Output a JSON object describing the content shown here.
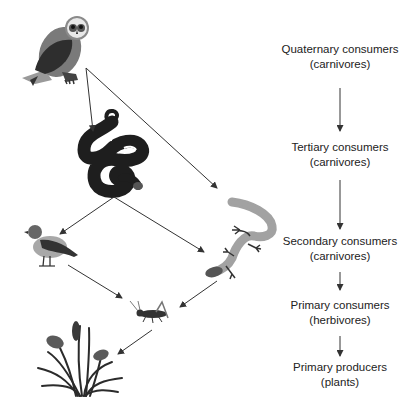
{
  "diagram": {
    "type": "food-web",
    "organisms": [
      {
        "id": "owl",
        "icon": "owl-icon",
        "level": "quaternary"
      },
      {
        "id": "snake",
        "icon": "snake-icon",
        "level": "tertiary"
      },
      {
        "id": "bird",
        "icon": "bird-icon",
        "level": "secondary"
      },
      {
        "id": "lizard",
        "icon": "lizard-icon",
        "level": "secondary"
      },
      {
        "id": "grasshopper",
        "icon": "grasshopper-icon",
        "level": "primary"
      },
      {
        "id": "plants",
        "icon": "cattail-plants-icon",
        "level": "producer"
      }
    ],
    "arrows": [
      {
        "from": "owl",
        "to": "snake"
      },
      {
        "from": "owl",
        "to": "lizard"
      },
      {
        "from": "snake",
        "to": "bird"
      },
      {
        "from": "snake",
        "to": "lizard"
      },
      {
        "from": "bird",
        "to": "grasshopper"
      },
      {
        "from": "lizard",
        "to": "grasshopper"
      },
      {
        "from": "grasshopper",
        "to": "plants"
      }
    ]
  },
  "levels": [
    {
      "title": "Quaternary consumers",
      "subtitle": "(carnivores)"
    },
    {
      "title": "Tertiary consumers",
      "subtitle": "(carnivores)"
    },
    {
      "title": "Secondary consumers",
      "subtitle": "(carnivores)"
    },
    {
      "title": "Primary consumers",
      "subtitle": "(herbivores)"
    },
    {
      "title": "Primary producers",
      "subtitle": "(plants)"
    }
  ],
  "colors": {
    "dark": "#2b2b2b",
    "mid": "#6e6e6e",
    "light": "#a9a9a9",
    "arrow": "#333333"
  }
}
